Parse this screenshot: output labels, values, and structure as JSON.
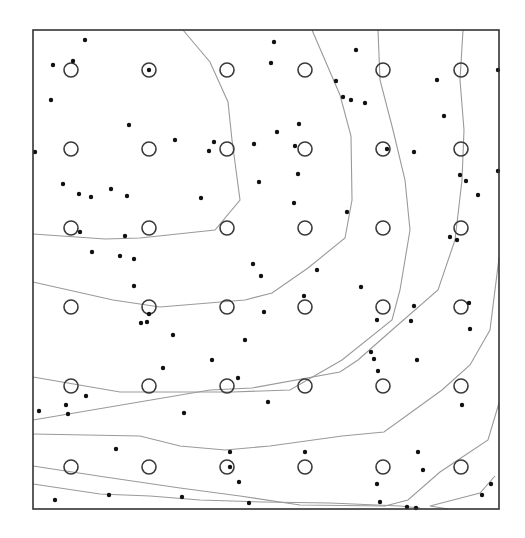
{
  "chart_data": {
    "type": "scatter",
    "title": "",
    "xlabel": "",
    "ylabel": "",
    "grid": false,
    "legend": null,
    "frame": {
      "x0": 33,
      "y0": 30,
      "x1": 499,
      "y1": 509
    },
    "colors": {
      "frame": "#333333",
      "circle_stroke": "#3a3a3a",
      "dot": "#111111",
      "contour": "#9a9a9a"
    },
    "series": [
      {
        "name": "grid-sites",
        "marker": "open-circle",
        "radius": 7,
        "x": [
          71,
          149,
          227,
          305,
          383,
          461
        ],
        "y": [
          70,
          149,
          228,
          307,
          386,
          467
        ]
      },
      {
        "name": "sample-points",
        "marker": "filled-dot",
        "radius": 2.2,
        "points": [
          [
            85,
            40
          ],
          [
            53,
            65
          ],
          [
            73,
            61
          ],
          [
            149,
            70
          ],
          [
            51,
            100
          ],
          [
            129,
            125
          ],
          [
            175,
            140
          ],
          [
            214,
            142
          ],
          [
            209,
            151
          ],
          [
            254,
            144
          ],
          [
            35,
            152
          ],
          [
            63,
            184
          ],
          [
            79,
            194
          ],
          [
            91,
            197
          ],
          [
            111,
            189
          ],
          [
            127,
            196
          ],
          [
            201,
            198
          ],
          [
            80,
            232
          ],
          [
            125,
            236
          ],
          [
            134,
            259
          ],
          [
            92,
            252
          ],
          [
            120,
            256
          ],
          [
            253,
            264
          ],
          [
            259,
            182
          ],
          [
            274,
            42
          ],
          [
            271,
            63
          ],
          [
            356,
            50
          ],
          [
            336,
            81
          ],
          [
            343,
            97
          ],
          [
            351,
            100
          ],
          [
            365,
            103
          ],
          [
            437,
            80
          ],
          [
            444,
            116
          ],
          [
            299,
            124
          ],
          [
            277,
            132
          ],
          [
            295,
            146
          ],
          [
            387,
            149
          ],
          [
            414,
            152
          ],
          [
            498,
            70
          ],
          [
            298,
            174
          ],
          [
            460,
            175
          ],
          [
            466,
            181
          ],
          [
            498,
            171
          ],
          [
            478,
            195
          ],
          [
            294,
            203
          ],
          [
            347,
            212
          ],
          [
            450,
            237
          ],
          [
            457,
            240
          ],
          [
            134,
            286
          ],
          [
            149,
            314
          ],
          [
            141,
            323
          ],
          [
            147,
            322
          ],
          [
            173,
            335
          ],
          [
            245,
            340
          ],
          [
            163,
            368
          ],
          [
            212,
            360
          ],
          [
            238,
            378
          ],
          [
            86,
            396
          ],
          [
            66,
            405
          ],
          [
            39,
            411
          ],
          [
            68,
            414
          ],
          [
            184,
            413
          ],
          [
            116,
            449
          ],
          [
            230,
            452
          ],
          [
            230,
            467
          ],
          [
            239,
            482
          ],
          [
            55,
            500
          ],
          [
            109,
            495
          ],
          [
            182,
            497
          ],
          [
            249,
            503
          ],
          [
            317,
            270
          ],
          [
            261,
            276
          ],
          [
            361,
            287
          ],
          [
            304,
            296
          ],
          [
            414,
            306
          ],
          [
            469,
            303
          ],
          [
            264,
            312
          ],
          [
            470,
            329
          ],
          [
            377,
            320
          ],
          [
            411,
            321
          ],
          [
            374,
            359
          ],
          [
            371,
            352
          ],
          [
            417,
            360
          ],
          [
            378,
            371
          ],
          [
            462,
            405
          ],
          [
            268,
            402
          ],
          [
            305,
            452
          ],
          [
            418,
            452
          ],
          [
            423,
            470
          ],
          [
            377,
            484
          ],
          [
            380,
            502
          ],
          [
            491,
            484
          ],
          [
            482,
            495
          ],
          [
            407,
            507
          ],
          [
            416,
            508
          ]
        ]
      }
    ],
    "contours": [
      [
        [
          183,
          30
        ],
        [
          210,
          62
        ],
        [
          228,
          102
        ],
        [
          232,
          140
        ],
        [
          240,
          200
        ],
        [
          215,
          230
        ],
        [
          140,
          238
        ],
        [
          105,
          239
        ],
        [
          33,
          234
        ]
      ],
      [
        [
          312,
          30
        ],
        [
          340,
          95
        ],
        [
          351,
          136
        ],
        [
          352,
          200
        ],
        [
          345,
          238
        ],
        [
          308,
          268
        ],
        [
          272,
          293
        ],
        [
          245,
          300
        ],
        [
          160,
          307
        ],
        [
          113,
          300
        ],
        [
          33,
          282
        ]
      ],
      [
        [
          378,
          30
        ],
        [
          380,
          80
        ],
        [
          393,
          130
        ],
        [
          405,
          180
        ],
        [
          410,
          230
        ],
        [
          400,
          290
        ],
        [
          392,
          320
        ],
        [
          342,
          360
        ],
        [
          290,
          390
        ],
        [
          232,
          392
        ],
        [
          120,
          392
        ],
        [
          33,
          377
        ]
      ],
      [
        [
          463,
          30
        ],
        [
          460,
          80
        ],
        [
          464,
          130
        ],
        [
          462,
          180
        ],
        [
          455,
          240
        ],
        [
          438,
          290
        ],
        [
          392,
          330
        ],
        [
          358,
          360
        ],
        [
          340,
          372
        ],
        [
          252,
          388
        ],
        [
          210,
          390
        ],
        [
          33,
          420
        ]
      ],
      [
        [
          499,
          258
        ],
        [
          490,
          330
        ],
        [
          470,
          365
        ],
        [
          442,
          390
        ],
        [
          384,
          432
        ],
        [
          342,
          436
        ],
        [
          270,
          446
        ],
        [
          225,
          450
        ],
        [
          180,
          446
        ],
        [
          140,
          436
        ],
        [
          33,
          434
        ]
      ],
      [
        [
          499,
          403
        ],
        [
          488,
          440
        ],
        [
          440,
          472
        ],
        [
          408,
          500
        ],
        [
          385,
          506
        ],
        [
          300,
          505
        ],
        [
          240,
          496
        ],
        [
          180,
          488
        ],
        [
          105,
          477
        ],
        [
          33,
          466
        ]
      ],
      [
        [
          495,
          476
        ],
        [
          480,
          493
        ],
        [
          430,
          506
        ],
        [
          448,
          509
        ]
      ],
      [
        [
          33,
          484
        ],
        [
          100,
          494
        ],
        [
          150,
          496
        ],
        [
          200,
          500
        ],
        [
          262,
          502
        ],
        [
          330,
          503
        ],
        [
          400,
          506
        ],
        [
          420,
          508
        ]
      ]
    ]
  }
}
